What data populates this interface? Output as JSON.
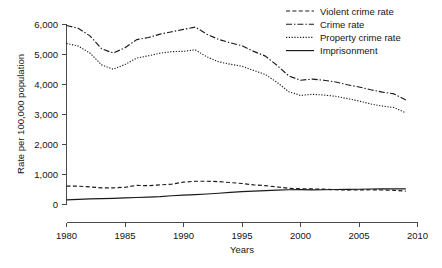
{
  "chart_data": {
    "type": "line",
    "title": "",
    "xlabel": "Years",
    "ylabel": "Rate per 100,000 population",
    "xlim": [
      1980,
      2010
    ],
    "ylim": [
      0,
      6000
    ],
    "grid": false,
    "legend_position": "top-right",
    "x_ticks": [
      "1980",
      "1985",
      "1990",
      "1995",
      "2000",
      "2005",
      "2010"
    ],
    "x_tick_values": [
      1980,
      1985,
      1990,
      1995,
      2000,
      2005,
      2010
    ],
    "y_ticks": [
      "0",
      "1,000",
      "2,000",
      "3,000",
      "4,000",
      "5,000",
      "6,000"
    ],
    "y_tick_values": [
      0,
      1000,
      2000,
      3000,
      4000,
      5000,
      6000
    ],
    "x": [
      1980,
      1981,
      1982,
      1983,
      1984,
      1985,
      1986,
      1987,
      1988,
      1989,
      1990,
      1991,
      1992,
      1993,
      1994,
      1995,
      1996,
      1997,
      1998,
      1999,
      2000,
      2001,
      2002,
      2003,
      2004,
      2005,
      2006,
      2007,
      2008,
      2009
    ],
    "series": [
      {
        "name": "Violent crime rate",
        "style": "dashed",
        "values": [
          597,
          594,
          571,
          538,
          539,
          557,
          620,
          610,
          637,
          663,
          730,
          758,
          758,
          747,
          714,
          685,
          637,
          611,
          568,
          523,
          507,
          504,
          494,
          476,
          463,
          469,
          474,
          467,
          455,
          429
        ]
      },
      {
        "name": "Crime rate",
        "style": "dash-dot",
        "values": [
          5950,
          5858,
          5604,
          5175,
          5031,
          5207,
          5480,
          5550,
          5664,
          5741,
          5820,
          5898,
          5661,
          5487,
          5374,
          5275,
          5087,
          4930,
          4620,
          4267,
          4125,
          4163,
          4125,
          4067,
          3977,
          3901,
          3809,
          3730,
          3669,
          3466
        ]
      },
      {
        "name": "Property crime rate",
        "style": "dotted",
        "values": [
          5353,
          5264,
          5033,
          4637,
          4492,
          4651,
          4863,
          4940,
          5027,
          5078,
          5089,
          5140,
          4903,
          4740,
          4660,
          4591,
          4451,
          4316,
          4052,
          3744,
          3618,
          3658,
          3631,
          3591,
          3514,
          3432,
          3335,
          3264,
          3215,
          3036
        ]
      },
      {
        "name": "Imprisonment",
        "style": "solid",
        "values": [
          139,
          154,
          171,
          179,
          188,
          202,
          217,
          231,
          247,
          276,
          297,
          313,
          332,
          359,
          389,
          411,
          427,
          444,
          461,
          476,
          478,
          470,
          476,
          482,
          486,
          491,
          501,
          506,
          504,
          502
        ]
      }
    ]
  },
  "legend": {
    "items": [
      {
        "label": "Violent crime rate"
      },
      {
        "label": "Crime rate"
      },
      {
        "label": "Property crime rate"
      },
      {
        "label": "Imprisonment"
      }
    ]
  }
}
